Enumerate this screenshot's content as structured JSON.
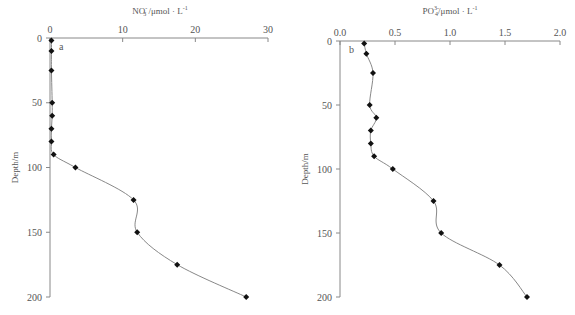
{
  "chart_data": [
    {
      "type": "line",
      "panel_label": "a",
      "title": "",
      "xlabel": "NO3- /μmol · L-1",
      "xlabel_parts": {
        "base": "NO",
        "sub": "3",
        "sup": "-",
        "unit": " /μmol · L",
        "unit_sup": "-1"
      },
      "ylabel": "Depth/m",
      "xlim": [
        0,
        30
      ],
      "ylim": [
        0,
        200
      ],
      "y_inverted": true,
      "x_axis_position": "top",
      "x_ticks": [
        "0",
        "10",
        "20",
        "30"
      ],
      "y_ticks": [
        "0",
        "50",
        "100",
        "150",
        "200"
      ],
      "grid": false,
      "series": [
        {
          "name": "NO3-",
          "depth": [
            2,
            10,
            25,
            50,
            60,
            70,
            80,
            90,
            100,
            125,
            150,
            175,
            200
          ],
          "values": [
            0.2,
            0.2,
            0.2,
            0.3,
            0.3,
            0.2,
            0.2,
            0.5,
            3.5,
            11.5,
            12.0,
            17.5,
            27.0
          ]
        }
      ]
    },
    {
      "type": "line",
      "panel_label": "b",
      "title": "",
      "xlabel": "PO4 3- /μmol · L-1",
      "xlabel_parts": {
        "base": "PO",
        "sub": "4",
        "sup": "3-",
        "unit": "/μmol · L",
        "unit_sup": "-1"
      },
      "ylabel": "Depth/m",
      "xlim": [
        0.0,
        2.0
      ],
      "ylim": [
        0,
        200
      ],
      "y_inverted": true,
      "x_axis_position": "top",
      "x_ticks": [
        "0.0",
        "0.5",
        "1.0",
        "1.5",
        "2.0"
      ],
      "y_ticks": [
        "0",
        "50",
        "100",
        "150",
        "200"
      ],
      "grid": false,
      "series": [
        {
          "name": "PO4 3-",
          "depth": [
            2,
            10,
            25,
            50,
            60,
            70,
            80,
            90,
            100,
            125,
            150,
            175,
            200
          ],
          "values": [
            0.22,
            0.24,
            0.3,
            0.27,
            0.33,
            0.28,
            0.28,
            0.31,
            0.48,
            0.85,
            0.92,
            1.45,
            1.7
          ]
        }
      ]
    }
  ]
}
